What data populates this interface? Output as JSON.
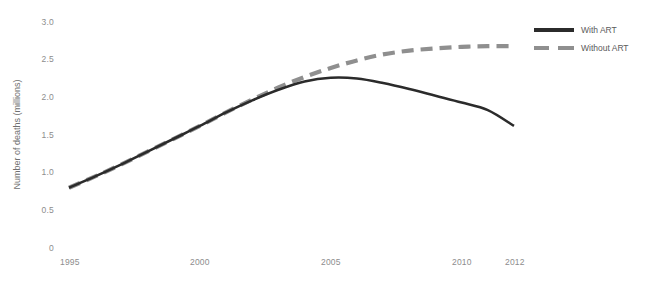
{
  "chart_data": {
    "type": "line",
    "title": "",
    "xlabel": "",
    "ylabel": "Number of deaths (millions)",
    "xlim": [
      1995,
      2012
    ],
    "ylim": [
      0,
      3.0
    ],
    "grid": false,
    "legend_position": "right",
    "x_tick_labels": [
      "1995",
      "2000",
      "2005",
      "2010",
      "2012"
    ],
    "x_tick_values": [
      1995,
      2000,
      2005,
      2010,
      2012
    ],
    "y_tick_labels": [
      "3.0",
      "2.5",
      "2.0",
      "1.5",
      "1.0",
      "0.5",
      "0"
    ],
    "y_tick_values": [
      3.0,
      2.5,
      2.0,
      1.5,
      1.0,
      0.5,
      0
    ],
    "x": [
      1995,
      1996,
      1997,
      1998,
      1999,
      2000,
      2001,
      2002,
      2003,
      2004,
      2005,
      2006,
      2007,
      2008,
      2009,
      2010,
      2011,
      2012
    ],
    "series": [
      {
        "name": "With ART",
        "style": "solid",
        "color": "#2b2b2b",
        "values": [
          0.8,
          0.95,
          1.11,
          1.28,
          1.45,
          1.62,
          1.8,
          1.96,
          2.1,
          2.21,
          2.26,
          2.25,
          2.19,
          2.11,
          2.02,
          1.93,
          1.83,
          1.62
        ]
      },
      {
        "name": "Without ART",
        "style": "dashed",
        "color": "#8f8f8f",
        "values": [
          0.8,
          0.95,
          1.11,
          1.28,
          1.45,
          1.62,
          1.8,
          1.97,
          2.13,
          2.27,
          2.39,
          2.49,
          2.57,
          2.62,
          2.65,
          2.67,
          2.68,
          2.68
        ]
      }
    ]
  },
  "legend": {
    "items": [
      {
        "label": "With ART",
        "style": "solid"
      },
      {
        "label": "Without ART",
        "style": "dashed"
      }
    ]
  }
}
